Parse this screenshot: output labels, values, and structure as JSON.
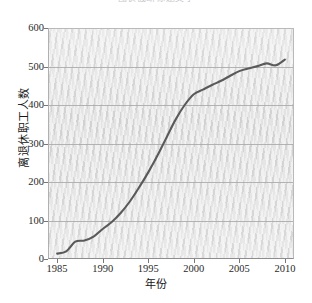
{
  "top_caption": "图表截断标题文字",
  "chart_data": {
    "type": "line",
    "title": "",
    "xlabel": "年份",
    "ylabel": "离退休职工人数",
    "xlim": [
      1984,
      2011
    ],
    "ylim": [
      0,
      600
    ],
    "xticks": [
      1985,
      1990,
      1995,
      2000,
      2005,
      2010
    ],
    "xtick_labels": [
      "1985",
      "1990",
      "1995",
      "2000",
      "2005",
      "2010"
    ],
    "yticks": [
      0,
      100,
      200,
      300,
      400,
      500,
      600
    ],
    "ytick_labels": [
      "0",
      "100",
      "200",
      "300",
      "400",
      "500",
      "600"
    ],
    "grid": "horizontal",
    "legend": "none",
    "line_color": "#5a5a5a",
    "plot_background": "#e2e2e2",
    "series": [
      {
        "name": "离退休职工人数",
        "x": [
          1985,
          1986,
          1987,
          1988,
          1989,
          1990,
          1991,
          1992,
          1993,
          1994,
          1995,
          1996,
          1997,
          1998,
          1999,
          2000,
          2001,
          2002,
          2003,
          2004,
          2005,
          2006,
          2007,
          2008,
          2009,
          2010
        ],
        "values": [
          14,
          20,
          45,
          48,
          58,
          78,
          96,
          120,
          150,
          186,
          225,
          268,
          315,
          362,
          400,
          428,
          440,
          452,
          463,
          476,
          488,
          495,
          501,
          508,
          503,
          518
        ]
      }
    ]
  }
}
